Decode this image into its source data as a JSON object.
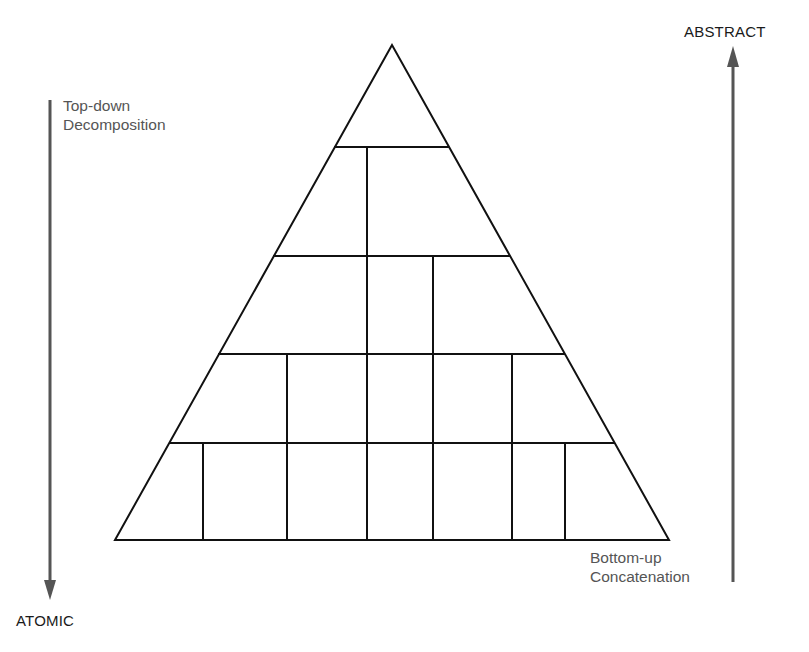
{
  "diagram": {
    "title": "",
    "labels": {
      "top_right": "ABSTRACT",
      "bottom_left": "ATOMIC",
      "left_arrow_line1": "Top-down",
      "left_arrow_line2": "Decomposition",
      "right_arrow_line1": "Bottom-up",
      "right_arrow_line2": "Concatenation"
    },
    "arrows": [
      {
        "name": "top-down-arrow",
        "direction": "down",
        "from": "Top-down Decomposition",
        "to": "ATOMIC"
      },
      {
        "name": "bottom-up-arrow",
        "direction": "up",
        "from": "Bottom-up Concatenation",
        "to": "ABSTRACT"
      }
    ],
    "pyramid": {
      "levels": [
        {
          "level": 0,
          "blocks": 1
        },
        {
          "level": 1,
          "blocks": 2
        },
        {
          "level": 2,
          "blocks": 3
        },
        {
          "level": 3,
          "blocks": 5
        },
        {
          "level": 4,
          "blocks": 7
        }
      ]
    },
    "colors": {
      "line": "#111111",
      "arrow": "#555555",
      "text_gray": "#555555",
      "text_dark": "#1a1a1a",
      "background": "#ffffff"
    }
  }
}
